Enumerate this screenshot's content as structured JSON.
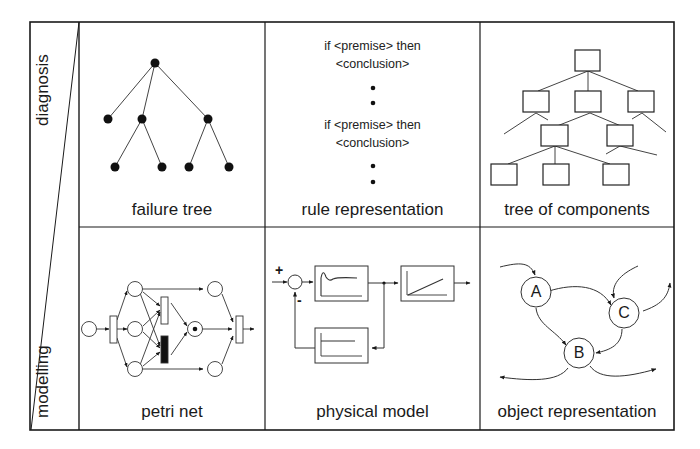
{
  "rows": [
    {
      "label": "diagnosis"
    },
    {
      "label": "modelling"
    }
  ],
  "cells": {
    "failure_tree": {
      "label": "failure tree"
    },
    "rule_representation": {
      "label": "rule representation",
      "rules": [
        {
          "line1": "if <premise> then",
          "line2": "<conclusion>"
        },
        {
          "line1": "if <premise> then",
          "line2": "<conclusion>"
        }
      ]
    },
    "tree_of_components": {
      "label": "tree of components"
    },
    "petri_net": {
      "label": "petri net"
    },
    "physical_model": {
      "label": "physical model",
      "plus_sign": "+",
      "minus_sign": "-"
    },
    "object_representation": {
      "label": "object representation",
      "nodes": [
        "A",
        "B",
        "C"
      ]
    }
  },
  "colors": {
    "line": "#1a1a1a",
    "background": "#ffffff"
  }
}
